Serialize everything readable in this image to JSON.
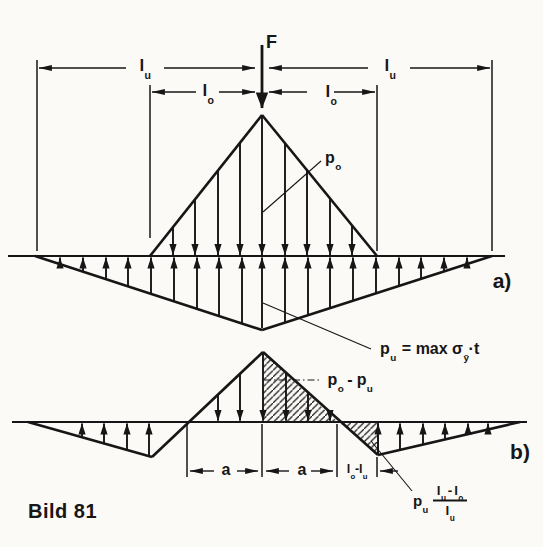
{
  "colors": {
    "ink": "#161616",
    "paper": "#fbfaf7"
  },
  "labels": {
    "force": "F",
    "dim_lu_left": {
      "base": "l",
      "sub": "u"
    },
    "dim_lu_right": {
      "base": "l",
      "sub": "u"
    },
    "dim_lo_left": {
      "base": "l",
      "sub": "o"
    },
    "dim_lo_right": {
      "base": "l",
      "sub": "o"
    },
    "po": {
      "base": "p",
      "sub": "o"
    },
    "panel_a": "a)",
    "pu_formula": {
      "base": "p",
      "sub": "u",
      "mid": "= max σ",
      "sigma_sub": "ȳ",
      "tail": "·t"
    },
    "po_minus_pu": {
      "p1": "p",
      "s1": "o",
      "minus": "-",
      "p2": "p",
      "s2": "u"
    },
    "dim_a_left": "a",
    "dim_a_right": "a",
    "dim_lo_minus_lu": {
      "l1": "l",
      "s1": "o",
      "minus": "-",
      "l2": "l",
      "s2": "u"
    },
    "panel_b": "b)",
    "pu_fraction": {
      "p": "p",
      "p_sub": "u",
      "num_l1": "l",
      "num_s1": "u",
      "minus": "-",
      "num_l2": "l",
      "num_s2": "o",
      "den": "l",
      "den_sub": "u"
    },
    "caption": "Bild 81"
  }
}
